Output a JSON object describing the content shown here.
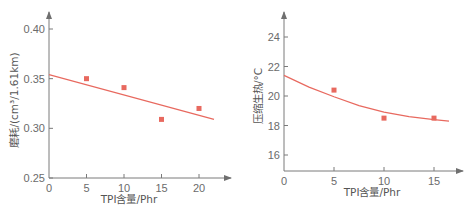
{
  "colors": {
    "axis": "#7a7a7a",
    "text": "#6b6b6b",
    "fit_line": "#e8695f",
    "marker": "#e8695f"
  },
  "chart_data": [
    {
      "type": "scatter",
      "title": "",
      "xlabel": "TPI含量/Phr",
      "ylabel": "磨耗/(cm³/1.61km)",
      "xlim": [
        0,
        23
      ],
      "ylim": [
        0.25,
        0.42
      ],
      "xticks": [
        "0",
        "5",
        "10",
        "15",
        "20"
      ],
      "yticks": [
        "0.25",
        "0.30",
        "0.35",
        "0.40"
      ],
      "grid": false,
      "legend": null,
      "series": [
        {
          "name": "measured",
          "kind": "markers",
          "x": [
            5,
            10,
            15,
            20
          ],
          "y": [
            0.35,
            0.341,
            0.309,
            0.32
          ]
        },
        {
          "name": "fit",
          "kind": "linear",
          "x": [
            0,
            22
          ],
          "y": [
            0.354,
            0.309
          ]
        }
      ]
    },
    {
      "type": "scatter",
      "title": "",
      "xlabel": "TPI含量/Phr",
      "ylabel": "压缩生热/°C",
      "xlim": [
        0,
        17
      ],
      "ylim": [
        15,
        25
      ],
      "xticks": [
        "0",
        "5",
        "10",
        "15"
      ],
      "yticks": [
        "16",
        "18",
        "20",
        "22",
        "24"
      ],
      "grid": false,
      "legend": null,
      "series": [
        {
          "name": "measured",
          "kind": "markers",
          "x": [
            5,
            10,
            15
          ],
          "y": [
            20.4,
            18.5,
            18.5
          ]
        },
        {
          "name": "fit",
          "kind": "quadratic",
          "x": [
            0,
            2.5,
            5,
            7.5,
            10,
            12.5,
            15,
            16.5
          ],
          "y": [
            21.4,
            20.6,
            19.95,
            19.35,
            18.9,
            18.6,
            18.4,
            18.3
          ]
        }
      ]
    }
  ]
}
